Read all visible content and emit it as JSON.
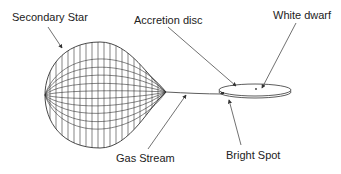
{
  "diagram": {
    "labels": {
      "secondary_star": "Secondary Star",
      "accretion_disc": "Accretion disc",
      "white_dwarf": "White dwarf",
      "gas_stream": "Gas Stream",
      "bright_spot": "Bright Spot"
    },
    "colors": {
      "line": "#333333",
      "background": "#ffffff"
    }
  }
}
